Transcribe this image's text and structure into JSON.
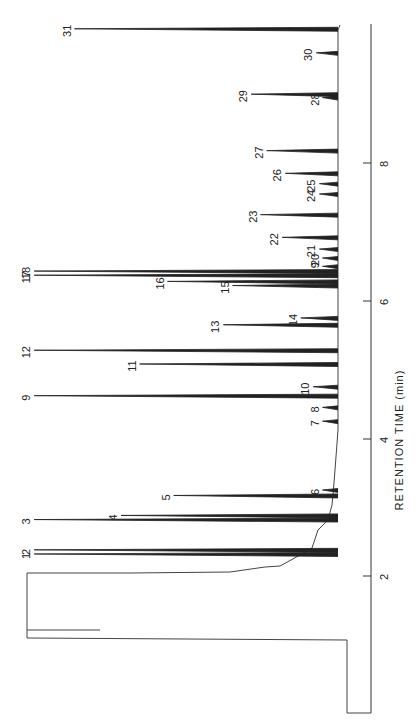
{
  "chart_data": {
    "type": "line",
    "orientation": "rotated-90 (time axis vertical, increasing upward; response extends leftward)",
    "title": "",
    "xlabel": "RETENTION TIME (min)",
    "ylabel": "",
    "xticks": [
      "2",
      "4",
      "6",
      "8"
    ],
    "xlim": [
      0.9,
      9.1
    ],
    "grid": false,
    "legend": null,
    "peaks": [
      {
        "label": "1",
        "time": 2.32,
        "rel_height": 0.98
      },
      {
        "label": "2",
        "time": 2.38,
        "rel_height": 0.98
      },
      {
        "label": "3",
        "time": 2.82,
        "rel_height": 0.98
      },
      {
        "label": "4",
        "time": 2.88,
        "rel_height": 0.7
      },
      {
        "label": "5",
        "time": 3.17,
        "rel_height": 0.53
      },
      {
        "label": "6",
        "time": 3.25,
        "rel_height": 0.05
      },
      {
        "label": "7",
        "time": 4.25,
        "rel_height": 0.05
      },
      {
        "label": "8",
        "time": 4.45,
        "rel_height": 0.05
      },
      {
        "label": "9",
        "time": 4.62,
        "rel_height": 0.98
      },
      {
        "label": "10",
        "time": 4.75,
        "rel_height": 0.08
      },
      {
        "label": "11",
        "time": 5.08,
        "rel_height": 0.64
      },
      {
        "label": "12",
        "time": 5.28,
        "rel_height": 0.98
      },
      {
        "label": "13",
        "time": 5.65,
        "rel_height": 0.37
      },
      {
        "label": "14",
        "time": 5.75,
        "rel_height": 0.12
      },
      {
        "label": "15",
        "time": 6.22,
        "rel_height": 0.34
      },
      {
        "label": "16",
        "time": 6.28,
        "rel_height": 0.55
      },
      {
        "label": "17",
        "time": 6.37,
        "rel_height": 0.98
      },
      {
        "label": "18",
        "time": 6.43,
        "rel_height": 0.98
      },
      {
        "label": "19",
        "time": 6.5,
        "rel_height": 0.05
      },
      {
        "label": "20",
        "time": 6.62,
        "rel_height": 0.05
      },
      {
        "label": "21",
        "time": 6.75,
        "rel_height": 0.06
      },
      {
        "label": "22",
        "time": 6.92,
        "rel_height": 0.18
      },
      {
        "label": "23",
        "time": 7.25,
        "rel_height": 0.25
      },
      {
        "label": "24",
        "time": 7.55,
        "rel_height": 0.06
      },
      {
        "label": "25",
        "time": 7.7,
        "rel_height": 0.06
      },
      {
        "label": "26",
        "time": 7.85,
        "rel_height": 0.17
      },
      {
        "label": "27",
        "time": 8.18,
        "rel_height": 0.23
      },
      {
        "label": "28",
        "time": 8.95,
        "rel_height": 0.05
      },
      {
        "label": "29",
        "time": 9.0,
        "rel_height": 0.28
      },
      {
        "label": "30",
        "time": 9.6,
        "rel_height": 0.07
      },
      {
        "label": "31",
        "time": 9.95,
        "rel_height": 0.85
      }
    ]
  },
  "axis": {
    "title": "RETENTION TIME (min)",
    "ticks": [
      {
        "label": "2",
        "y": 576
      },
      {
        "label": "4",
        "y": 439
      },
      {
        "label": "6",
        "y": 301
      },
      {
        "label": "8",
        "y": 163
      }
    ]
  }
}
